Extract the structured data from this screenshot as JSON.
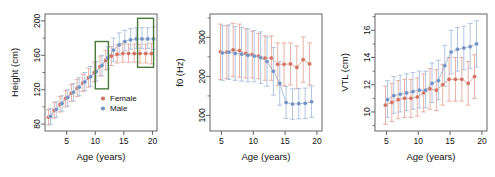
{
  "figure": {
    "type": "multi-panel-scatter-errorbar",
    "panel_count": 3,
    "background": "#ffffff",
    "series_colors": {
      "female": "#d2705f",
      "male": "#7290c0"
    },
    "errorbar_colors": {
      "female": "#e7a79a",
      "male": "#a8bedd"
    },
    "annotation_color": "#4a7a3c"
  },
  "legend": {
    "entries": [
      {
        "label": "Female",
        "color": "#d2705f",
        "marker": "circle"
      },
      {
        "label": "Male",
        "color": "#7290c0",
        "marker": "circle"
      }
    ]
  },
  "chart_data": [
    {
      "type": "scatter",
      "panel": 1,
      "title": "",
      "xlabel": "Age (years)",
      "ylabel": "Height (cm)",
      "xlim": [
        1.2,
        20.8
      ],
      "ylim": [
        72,
        208
      ],
      "xticks": [
        5,
        10,
        15,
        20
      ],
      "yticks": [
        80,
        120,
        160,
        200
      ],
      "grid": false,
      "legend_position": "bottom-right",
      "x": [
        2,
        3,
        4,
        5,
        6,
        7,
        8,
        9,
        10,
        11,
        12,
        13,
        14,
        15,
        16,
        17,
        18,
        19,
        20
      ],
      "series": [
        {
          "name": "Female",
          "color": "#d2705f",
          "values": [
            88,
            96,
            103,
            110,
            116,
            122,
            128,
            134,
            140,
            147,
            154,
            159,
            161,
            162,
            162,
            162,
            162,
            162,
            162
          ],
          "err_low": [
            79,
            87,
            94,
            100,
            106,
            112,
            118,
            123,
            129,
            136,
            143,
            148,
            151,
            152,
            152,
            152,
            151,
            151,
            150
          ],
          "err_high": [
            97,
            105,
            112,
            119,
            126,
            132,
            138,
            145,
            152,
            159,
            166,
            170,
            172,
            173,
            173,
            173,
            173,
            173,
            174
          ]
        },
        {
          "name": "Male",
          "color": "#7290c0",
          "values": [
            89,
            97,
            104,
            111,
            117,
            123,
            129,
            135,
            141,
            148,
            157,
            166,
            172,
            176,
            178,
            179,
            179,
            179,
            179
          ],
          "err_low": [
            80,
            88,
            95,
            101,
            107,
            113,
            119,
            124,
            130,
            136,
            144,
            153,
            160,
            165,
            167,
            168,
            168,
            168,
            167
          ],
          "err_high": [
            98,
            106,
            113,
            120,
            127,
            134,
            140,
            147,
            153,
            160,
            170,
            180,
            186,
            189,
            191,
            192,
            192,
            192,
            193
          ]
        }
      ],
      "annotations": [
        {
          "type": "rect",
          "label": "highlight-box-left",
          "x0": 10.0,
          "x1": 12.3,
          "y0": 121,
          "y1": 176,
          "color": "#4a7a3c"
        },
        {
          "type": "rect",
          "label": "highlight-box-right",
          "x0": 17.4,
          "x1": 20.2,
          "y0": 146,
          "y1": 203,
          "color": "#4a7a3c"
        }
      ]
    },
    {
      "type": "scatter",
      "panel": 2,
      "title": "",
      "xlabel": "Age (years)",
      "ylabel": "f0 (Hz)",
      "xlim": [
        3.2,
        20.8
      ],
      "ylim": [
        60,
        360
      ],
      "xticks": [
        5,
        10,
        15,
        20
      ],
      "yticks": [
        100,
        200,
        300
      ],
      "grid": false,
      "x": [
        5,
        6,
        7,
        8,
        9,
        10,
        11,
        12,
        13,
        14,
        15,
        16,
        17,
        18,
        19
      ],
      "series": [
        {
          "name": "Female",
          "color": "#d2705f",
          "values": [
            263,
            262,
            268,
            266,
            259,
            256,
            252,
            247,
            247,
            231,
            231,
            232,
            223,
            243,
            232
          ],
          "err_low": [
            192,
            195,
            200,
            198,
            196,
            196,
            194,
            190,
            190,
            176,
            176,
            178,
            168,
            185,
            178
          ],
          "err_high": [
            334,
            330,
            336,
            334,
            322,
            316,
            310,
            304,
            304,
            286,
            286,
            286,
            278,
            301,
            286
          ]
        },
        {
          "name": "Male",
          "color": "#7290c0",
          "values": [
            260,
            262,
            259,
            257,
            254,
            252,
            248,
            238,
            213,
            182,
            133,
            129,
            130,
            131,
            135
          ],
          "err_low": [
            190,
            192,
            190,
            188,
            186,
            186,
            182,
            175,
            152,
            126,
            92,
            90,
            91,
            92,
            95
          ],
          "err_high": [
            330,
            332,
            328,
            326,
            322,
            318,
            314,
            301,
            274,
            238,
            174,
            168,
            169,
            170,
            175
          ]
        }
      ]
    },
    {
      "type": "scatter",
      "panel": 3,
      "title": "",
      "xlabel": "Age (years)",
      "ylabel": "VTL (cm)",
      "xlim": [
        3.2,
        20.8
      ],
      "ylim": [
        8.6,
        17.2
      ],
      "xticks": [
        5,
        10,
        15,
        20
      ],
      "yticks": [
        10,
        12,
        14,
        16
      ],
      "grid": false,
      "x": [
        5,
        6,
        7,
        8,
        9,
        10,
        11,
        12,
        13,
        14,
        15,
        16,
        17,
        18,
        19
      ],
      "series": [
        {
          "name": "Female",
          "color": "#d2705f",
          "values": [
            10.5,
            10.7,
            10.9,
            11.0,
            11.0,
            11.1,
            11.4,
            11.7,
            11.6,
            12.0,
            12.4,
            12.4,
            12.4,
            12.1,
            12.6
          ],
          "err_low": [
            9.1,
            9.3,
            9.5,
            9.6,
            9.6,
            9.7,
            10.0,
            10.2,
            10.1,
            10.5,
            10.8,
            10.8,
            10.8,
            10.5,
            11.0
          ],
          "err_high": [
            11.9,
            12.1,
            12.3,
            12.4,
            12.4,
            12.5,
            12.8,
            13.2,
            13.1,
            13.5,
            14.0,
            14.0,
            14.0,
            13.7,
            14.2
          ]
        },
        {
          "name": "Male",
          "color": "#7290c0",
          "values": [
            10.9,
            11.2,
            11.3,
            11.4,
            11.5,
            11.6,
            11.6,
            12.1,
            12.3,
            13.4,
            14.4,
            14.6,
            14.7,
            14.8,
            15.0
          ],
          "err_low": [
            9.6,
            9.9,
            10.0,
            10.1,
            10.2,
            10.3,
            10.3,
            10.7,
            10.9,
            11.9,
            12.8,
            13.0,
            13.1,
            13.2,
            13.3
          ],
          "err_high": [
            12.3,
            12.6,
            12.7,
            12.8,
            12.9,
            13.0,
            13.0,
            13.6,
            13.8,
            14.9,
            16.0,
            16.2,
            16.3,
            16.5,
            16.7
          ]
        }
      ]
    }
  ]
}
